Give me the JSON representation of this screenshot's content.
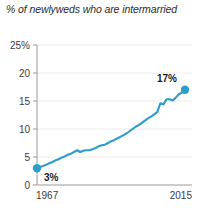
{
  "chart_data": {
    "type": "line",
    "title": "% of newlyweds who are intermarried",
    "xlabel": "",
    "ylabel": "",
    "xlim": [
      1967,
      2015
    ],
    "ylim": [
      0,
      25
    ],
    "grid": true,
    "legend": "none",
    "y_ticks": [
      "0",
      "5",
      "10",
      "15",
      "20",
      "25%"
    ],
    "y_tick_values": [
      0,
      5,
      10,
      15,
      20,
      25
    ],
    "x_ticks": [
      "1967",
      "2015"
    ],
    "x_tick_values": [
      1967,
      2015
    ],
    "series": [
      {
        "name": "Intermarried newlyweds",
        "color": "#2e9ccc",
        "x": [
          1967,
          1968,
          1969,
          1970,
          1971,
          1972,
          1973,
          1974,
          1975,
          1976,
          1977,
          1978,
          1979,
          1980,
          1981,
          1982,
          1983,
          1984,
          1985,
          1986,
          1987,
          1988,
          1989,
          1990,
          1991,
          1992,
          1993,
          1994,
          1995,
          1996,
          1997,
          1998,
          1999,
          2000,
          2001,
          2002,
          2003,
          2004,
          2005,
          2006,
          2007,
          2008,
          2009,
          2010,
          2011,
          2012,
          2013,
          2014,
          2015
        ],
        "values": [
          3.0,
          3.2,
          3.4,
          3.6,
          3.9,
          4.1,
          4.4,
          4.6,
          4.9,
          5.1,
          5.4,
          5.6,
          5.9,
          6.2,
          5.9,
          6.1,
          6.2,
          6.2,
          6.4,
          6.6,
          6.9,
          7.1,
          7.2,
          7.5,
          7.8,
          8.0,
          8.3,
          8.6,
          8.9,
          9.2,
          9.6,
          10.0,
          10.4,
          10.7,
          11.1,
          11.5,
          11.9,
          12.2,
          12.6,
          13.0,
          14.6,
          14.4,
          15.3,
          15.3,
          15.1,
          15.6,
          16.2,
          16.5,
          17.0
        ]
      }
    ],
    "annotations": [
      {
        "name": "start-point-label",
        "text": "3%",
        "x": 1967,
        "y": 3
      },
      {
        "name": "end-point-label",
        "text": "17%",
        "x": 2015,
        "y": 17
      }
    ],
    "markers": [
      {
        "name": "start-point-marker",
        "x": 1967,
        "y": 3
      },
      {
        "name": "end-point-marker",
        "x": 2015,
        "y": 17
      }
    ],
    "colors": {
      "line": "#2e9ccc",
      "marker": "#2e9ccc",
      "axis": "#9a9a9a",
      "grid": "#ebebeb",
      "text": "#3a3a3a",
      "title_text": "#2b2b2b",
      "background": "#ffffff"
    }
  }
}
